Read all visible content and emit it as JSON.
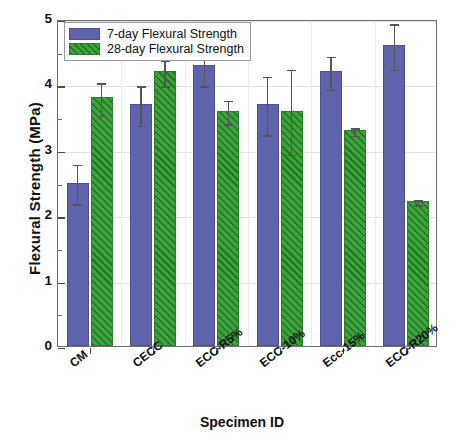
{
  "chart_data": {
    "type": "bar",
    "title": "",
    "xlabel": "Specimen ID",
    "ylabel": "Flexural Strength (MPa)",
    "ylim": [
      0,
      5
    ],
    "ytick_step": 1,
    "yminor_step": 0.5,
    "ytick_labels": [
      "0",
      "1",
      "2",
      "3",
      "4",
      "5"
    ],
    "grid": "horizontal-and-vertical-light",
    "legend_position": "top-left",
    "categories": [
      "CM",
      "CECC",
      "ECC-R5%",
      "ECC-10%",
      "Ecc-15%",
      "ECC-R20%"
    ],
    "series": [
      {
        "name": "7-day Flexural Strength",
        "color": "#5f63ac",
        "pattern": "solid",
        "values": [
          2.5,
          3.7,
          4.3,
          3.7,
          4.2,
          4.6
        ],
        "errors": [
          0.3,
          0.3,
          0.3,
          0.45,
          0.25,
          0.35
        ]
      },
      {
        "name": "28-day Flexural Strength",
        "color": "#3fa03f",
        "pattern": "diagonal-hatch",
        "values": [
          3.8,
          4.2,
          3.6,
          3.6,
          3.3,
          2.22
        ],
        "errors": [
          0.25,
          0.2,
          0.18,
          0.65,
          0.06,
          0.04
        ]
      }
    ]
  },
  "legend": {
    "items": [
      {
        "label": "7-day Flexural Strength"
      },
      {
        "label": "28-day Flexural Strength"
      }
    ]
  }
}
